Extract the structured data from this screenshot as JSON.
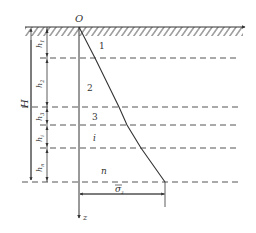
{
  "diagram": {
    "origin_label": "O",
    "axis_label": "z",
    "total_depth_label": "H",
    "layer_thickness_labels": [
      "h1",
      "h2",
      "h3",
      "hi",
      "hn"
    ],
    "layer_thickness_subscripts": [
      "1",
      "2",
      "3",
      "i",
      "n"
    ],
    "layer_labels": [
      "1",
      "2",
      "3",
      "i",
      "n"
    ],
    "stress_label": "σ",
    "stress_label_subscript": "z",
    "colors": {
      "line": "#333333",
      "dashed": "#555555",
      "background": "#ffffff"
    }
  }
}
